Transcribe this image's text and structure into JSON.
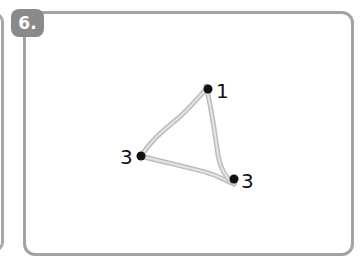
{
  "figure": {
    "step_badge": "6.",
    "graph": {
      "vertices": [
        {
          "id": "top",
          "label": "1",
          "x": 208,
          "y": 89
        },
        {
          "id": "left",
          "label": "3",
          "x": 141,
          "y": 156
        },
        {
          "id": "bottom-right",
          "label": "3",
          "x": 234,
          "y": 179
        }
      ],
      "edges": [
        [
          "top",
          "left"
        ],
        [
          "left",
          "bottom-right"
        ],
        [
          "top",
          "bottom-right"
        ]
      ],
      "edge_color": "#c9c9c9",
      "vertex_color": "#111111"
    }
  }
}
